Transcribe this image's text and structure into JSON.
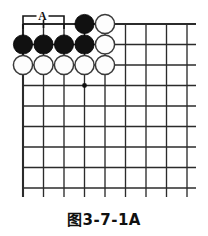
{
  "figure": {
    "kind": "go-board-diagram",
    "caption": "图3-7-1A"
  },
  "board": {
    "columns": 9,
    "rows": 9,
    "origin_x": 23,
    "origin_y": 24,
    "cell_size": 20.5,
    "overhang": 9,
    "line_color": "#2b2b2b",
    "background_color": "#ffffff",
    "stone_radius": 9.6,
    "star_points": [
      {
        "col": 4,
        "row": 4
      }
    ]
  },
  "stones": [
    {
      "color": "black",
      "col": 4,
      "row": 1
    },
    {
      "color": "white",
      "col": 5,
      "row": 1
    },
    {
      "color": "black",
      "col": 1,
      "row": 2
    },
    {
      "color": "black",
      "col": 2,
      "row": 2
    },
    {
      "color": "black",
      "col": 3,
      "row": 2
    },
    {
      "color": "black",
      "col": 4,
      "row": 2
    },
    {
      "color": "white",
      "col": 5,
      "row": 2
    },
    {
      "color": "white",
      "col": 1,
      "row": 3
    },
    {
      "color": "white",
      "col": 2,
      "row": 3
    },
    {
      "color": "white",
      "col": 3,
      "row": 3
    },
    {
      "color": "white",
      "col": 4,
      "row": 3
    },
    {
      "color": "white",
      "col": 5,
      "row": 3
    }
  ],
  "markers": [
    {
      "label": "A",
      "col": 2,
      "row": 1,
      "type": "point-label-on-edge"
    }
  ],
  "colors": {
    "black_stone": "#111111",
    "white_stone": "#fdfdfd",
    "white_stone_outline": "#3a3a3a",
    "grid": "#2b2b2b",
    "caption_text": "#101010"
  }
}
